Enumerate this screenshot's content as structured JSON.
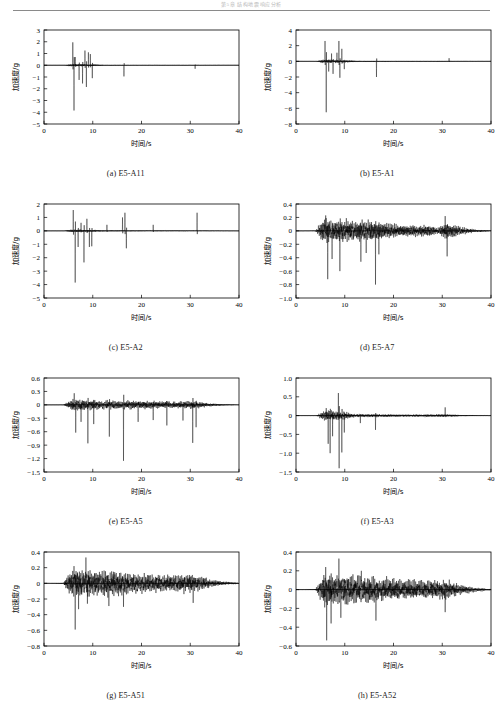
{
  "running_head": "第5章 结构地震响应分析",
  "figure": {
    "axis_labels": {
      "x": "时间/s",
      "y": "加速度/g"
    },
    "x_range": [
      0,
      40
    ],
    "x_ticks": [
      0,
      10,
      20,
      30,
      40
    ]
  },
  "chart_data": [
    {
      "type": "line",
      "id": "a",
      "caption": "(a) E5-A11",
      "xlabel": "时间/s",
      "ylabel": "加速度/g",
      "xlim": [
        0,
        40
      ],
      "ylim": [
        -5,
        3
      ],
      "xticks": [
        0,
        10,
        20,
        30,
        40
      ],
      "yticks": [
        -5,
        -4,
        -3,
        -2,
        -1,
        0,
        1,
        2,
        3
      ],
      "ytick_labels": [
        "-5",
        "-4",
        "-3",
        "-2",
        "-1",
        "0",
        "1",
        "2",
        "3"
      ],
      "grid": false,
      "legend": null,
      "description": "Acceleration time-history, sparse sharp spikes concentrated at 5-11 s, isolated spikes near 16.5 s and 30-32 s",
      "peaks": [
        {
          "t": 5.9,
          "v": 1.95
        },
        {
          "t": 6.15,
          "v": -3.85
        },
        {
          "t": 6.4,
          "v": 0.7
        },
        {
          "t": 7.2,
          "v": -1.25
        },
        {
          "t": 7.9,
          "v": -1.55
        },
        {
          "t": 8.4,
          "v": 1.25
        },
        {
          "t": 8.7,
          "v": -1.85
        },
        {
          "t": 9.1,
          "v": 1.1
        },
        {
          "t": 9.5,
          "v": 0.95
        },
        {
          "t": 9.9,
          "v": -1.1
        },
        {
          "t": 16.4,
          "v": -0.95
        },
        {
          "t": 31.0,
          "v": -0.3
        }
      ],
      "noise_amp": 0.09,
      "envelope": [
        {
          "t": 0,
          "a": 0.0
        },
        {
          "t": 4.2,
          "a": 0.02
        },
        {
          "t": 5.5,
          "a": 0.55
        },
        {
          "t": 7.5,
          "a": 0.5
        },
        {
          "t": 10.5,
          "a": 0.35
        },
        {
          "t": 12.5,
          "a": 0.12
        },
        {
          "t": 20,
          "a": 0.07
        },
        {
          "t": 30,
          "a": 0.07
        },
        {
          "t": 34,
          "a": 0.05
        },
        {
          "t": 40,
          "a": 0.01
        }
      ]
    },
    {
      "type": "line",
      "id": "b",
      "caption": "(b) E5-A1",
      "xlabel": "时间/s",
      "ylabel": "加速度/g",
      "xlim": [
        0,
        40
      ],
      "ylim": [
        -8,
        4
      ],
      "xticks": [
        0,
        10,
        20,
        30,
        40
      ],
      "yticks": [
        -8,
        -6,
        -4,
        -2,
        0,
        2,
        4
      ],
      "ytick_labels": [
        "-8",
        "-6",
        "-4",
        "-2",
        "0",
        "2",
        "4"
      ],
      "grid": false,
      "legend": null,
      "description": "Acceleration time-history with large negative spike -6.5 g near 6.2 s, activity 5-11 s, isolated spike near 16.5 s",
      "peaks": [
        {
          "t": 5.95,
          "v": 2.6
        },
        {
          "t": 6.2,
          "v": -6.5
        },
        {
          "t": 6.7,
          "v": -1.3
        },
        {
          "t": 7.3,
          "v": 1.0
        },
        {
          "t": 7.6,
          "v": -1.6
        },
        {
          "t": 8.4,
          "v": 1.1
        },
        {
          "t": 8.8,
          "v": 2.6
        },
        {
          "t": 9.0,
          "v": -2.1
        },
        {
          "t": 9.4,
          "v": 1.6
        },
        {
          "t": 9.9,
          "v": -1.0
        },
        {
          "t": 16.5,
          "v": -2.0
        },
        {
          "t": 31.4,
          "v": 0.4
        }
      ],
      "noise_amp": 0.14,
      "envelope": [
        {
          "t": 0,
          "a": 0.0
        },
        {
          "t": 4.2,
          "a": 0.03
        },
        {
          "t": 5.5,
          "a": 0.8
        },
        {
          "t": 7.5,
          "a": 0.7
        },
        {
          "t": 10.5,
          "a": 0.5
        },
        {
          "t": 12.5,
          "a": 0.18
        },
        {
          "t": 20,
          "a": 0.1
        },
        {
          "t": 30,
          "a": 0.1
        },
        {
          "t": 34,
          "a": 0.06
        },
        {
          "t": 40,
          "a": 0.01
        }
      ]
    },
    {
      "type": "line",
      "id": "c",
      "caption": "(c) E5-A2",
      "xlabel": "时间/s",
      "ylabel": "加速度/g",
      "xlim": [
        0,
        40
      ],
      "ylim": [
        -5,
        2
      ],
      "xticks": [
        0,
        10,
        20,
        30,
        40
      ],
      "yticks": [
        -5,
        -4,
        -3,
        -2,
        -1,
        0,
        1,
        2
      ],
      "ytick_labels": [
        "-5",
        "-4",
        "-3",
        "-2",
        "-1",
        "0",
        "1",
        "2"
      ],
      "grid": false,
      "legend": null,
      "description": "Spiky record, largest negative -3.85 g at 6.4 s, positive spikes to 1.4 g near 16.6 s and 31.4 s",
      "peaks": [
        {
          "t": 6.0,
          "v": 1.55
        },
        {
          "t": 6.4,
          "v": -3.85
        },
        {
          "t": 7.0,
          "v": -1.2
        },
        {
          "t": 7.6,
          "v": 0.6
        },
        {
          "t": 8.2,
          "v": -2.35
        },
        {
          "t": 8.8,
          "v": 0.9
        },
        {
          "t": 9.3,
          "v": -1.2
        },
        {
          "t": 9.8,
          "v": -1.15
        },
        {
          "t": 12.9,
          "v": 0.45
        },
        {
          "t": 16.1,
          "v": 1.0
        },
        {
          "t": 16.6,
          "v": 1.35
        },
        {
          "t": 16.9,
          "v": -1.3
        },
        {
          "t": 22.4,
          "v": 0.45
        },
        {
          "t": 31.4,
          "v": 1.35
        }
      ],
      "noise_amp": 0.1,
      "envelope": [
        {
          "t": 0,
          "a": 0.0
        },
        {
          "t": 4.2,
          "a": 0.02
        },
        {
          "t": 5.5,
          "a": 0.45
        },
        {
          "t": 7.5,
          "a": 0.42
        },
        {
          "t": 10.5,
          "a": 0.3
        },
        {
          "t": 12.5,
          "a": 0.16
        },
        {
          "t": 20,
          "a": 0.12
        },
        {
          "t": 30,
          "a": 0.1
        },
        {
          "t": 34,
          "a": 0.07
        },
        {
          "t": 40,
          "a": 0.02
        }
      ]
    },
    {
      "type": "line",
      "id": "d",
      "caption": "(d) E5-A7",
      "xlabel": "时间/s",
      "ylabel": "加速度/g",
      "xlim": [
        0,
        40
      ],
      "ylim": [
        -1.0,
        0.4
      ],
      "xticks": [
        0,
        10,
        20,
        30,
        40
      ],
      "yticks": [
        -1.0,
        -0.8,
        -0.6,
        -0.4,
        -0.2,
        0,
        0.2,
        0.4
      ],
      "ytick_labels": [
        "-1.0",
        "-0.8",
        "-0.6",
        "-0.4",
        "-0.2",
        "0",
        "0.2",
        "0.4"
      ],
      "grid": false,
      "legend": null,
      "description": "Dense broadband vibration 4-37 s, asymmetric with negative spikes to -0.8 g near 16.3 s",
      "peaks": [
        {
          "t": 6.1,
          "v": 0.23
        },
        {
          "t": 6.5,
          "v": -0.72
        },
        {
          "t": 7.4,
          "v": -0.42
        },
        {
          "t": 9.0,
          "v": -0.6
        },
        {
          "t": 13.3,
          "v": -0.46
        },
        {
          "t": 14.4,
          "v": -0.33
        },
        {
          "t": 16.3,
          "v": -0.8
        },
        {
          "t": 17.0,
          "v": -0.35
        },
        {
          "t": 30.6,
          "v": 0.22
        },
        {
          "t": 31.0,
          "v": -0.38
        }
      ],
      "noise_amp": 0.075,
      "envelope": [
        {
          "t": 0,
          "a": 0.0
        },
        {
          "t": 4.0,
          "a": 0.02
        },
        {
          "t": 5.5,
          "a": 1.0
        },
        {
          "t": 10,
          "a": 0.95
        },
        {
          "t": 16,
          "a": 0.85
        },
        {
          "t": 22,
          "a": 0.45
        },
        {
          "t": 27.5,
          "a": 0.5
        },
        {
          "t": 29,
          "a": 0.25
        },
        {
          "t": 31,
          "a": 0.75
        },
        {
          "t": 34,
          "a": 0.3
        },
        {
          "t": 37,
          "a": 0.12
        },
        {
          "t": 40,
          "a": 0.03
        }
      ]
    },
    {
      "type": "line",
      "id": "e",
      "caption": "(e) E5-A5",
      "xlabel": "时间/s",
      "ylabel": "加速度/g",
      "xlim": [
        0,
        40
      ],
      "ylim": [
        -1.5,
        0.6
      ],
      "xticks": [
        0,
        10,
        20,
        30,
        40
      ],
      "yticks": [
        -1.5,
        -1.2,
        -0.9,
        -0.6,
        -0.3,
        0,
        0.3,
        0.6
      ],
      "ytick_labels": [
        "-1.5",
        "-1.2",
        "-0.9",
        "-0.6",
        "-0.3",
        "0",
        "0.3",
        "0.6"
      ],
      "grid": false,
      "legend": null,
      "description": "Dense vibration with repeated downward spikes, largest -1.25 g near 16.3 s",
      "peaks": [
        {
          "t": 6.2,
          "v": 0.26
        },
        {
          "t": 6.5,
          "v": -0.62
        },
        {
          "t": 7.6,
          "v": -0.38
        },
        {
          "t": 9.0,
          "v": -0.86
        },
        {
          "t": 10.2,
          "v": -0.43
        },
        {
          "t": 13.4,
          "v": -0.71
        },
        {
          "t": 16.3,
          "v": -1.25
        },
        {
          "t": 19.3,
          "v": -0.38
        },
        {
          "t": 22.4,
          "v": -0.34
        },
        {
          "t": 25.2,
          "v": -0.46
        },
        {
          "t": 28.5,
          "v": -0.35
        },
        {
          "t": 30.5,
          "v": -0.85
        },
        {
          "t": 31.2,
          "v": -0.5
        }
      ],
      "noise_amp": 0.06,
      "envelope": [
        {
          "t": 0,
          "a": 0.0
        },
        {
          "t": 4.0,
          "a": 0.02
        },
        {
          "t": 5.8,
          "a": 1.0
        },
        {
          "t": 10,
          "a": 0.75
        },
        {
          "t": 16,
          "a": 0.7
        },
        {
          "t": 22,
          "a": 0.6
        },
        {
          "t": 28,
          "a": 0.55
        },
        {
          "t": 31,
          "a": 0.6
        },
        {
          "t": 34,
          "a": 0.25
        },
        {
          "t": 37,
          "a": 0.1
        },
        {
          "t": 40,
          "a": 0.03
        }
      ]
    },
    {
      "type": "line",
      "id": "f",
      "caption": "(f) E5-A3",
      "xlabel": "时间/s",
      "ylabel": "加速度/g",
      "xlim": [
        0,
        40
      ],
      "ylim": [
        -1.5,
        1.0
      ],
      "xticks": [
        0,
        10,
        20,
        30,
        40
      ],
      "yticks": [
        -1.5,
        -1.0,
        -0.5,
        0,
        0.5,
        1.0
      ],
      "ytick_labels": [
        "-1.5",
        "-1.0",
        "-0.5",
        "0",
        "0.5",
        "1.0"
      ],
      "grid": false,
      "legend": null,
      "description": "Burst of strong motion 5.5-10 s with peak -1.4 g at 8.8 s, then low-level vibration to 33 s",
      "peaks": [
        {
          "t": 6.2,
          "v": 0.2
        },
        {
          "t": 6.6,
          "v": -0.75
        },
        {
          "t": 7.0,
          "v": -1.0
        },
        {
          "t": 7.5,
          "v": -0.55
        },
        {
          "t": 8.7,
          "v": 0.6
        },
        {
          "t": 8.85,
          "v": -1.4
        },
        {
          "t": 9.4,
          "v": -0.98
        },
        {
          "t": 9.9,
          "v": -0.45
        },
        {
          "t": 13.2,
          "v": -0.2
        },
        {
          "t": 16.3,
          "v": -0.38
        },
        {
          "t": 30.6,
          "v": 0.22
        }
      ],
      "noise_amp": 0.06,
      "envelope": [
        {
          "t": 0,
          "a": 0.0
        },
        {
          "t": 4.2,
          "a": 0.02
        },
        {
          "t": 5.8,
          "a": 1.0
        },
        {
          "t": 10,
          "a": 0.8
        },
        {
          "t": 12,
          "a": 0.3
        },
        {
          "t": 16,
          "a": 0.3
        },
        {
          "t": 22,
          "a": 0.22
        },
        {
          "t": 28,
          "a": 0.26
        },
        {
          "t": 31,
          "a": 0.3
        },
        {
          "t": 34,
          "a": 0.12
        },
        {
          "t": 40,
          "a": 0.02
        }
      ]
    },
    {
      "type": "line",
      "id": "g",
      "caption": "(g) E5-A51",
      "xlabel": "时间/s",
      "ylabel": "加速度/g",
      "xlim": [
        0,
        40
      ],
      "ylim": [
        -0.8,
        0.4
      ],
      "xticks": [
        0,
        10,
        20,
        30,
        40
      ],
      "yticks": [
        -0.8,
        -0.6,
        -0.4,
        -0.2,
        0,
        0.2,
        0.4
      ],
      "ytick_labels": [
        "-0.8",
        "-0.6",
        "-0.4",
        "-0.2",
        "0",
        "0.2",
        "0.4"
      ],
      "grid": false,
      "legend": null,
      "description": "Continuous dense oscillation 4-38 s, peak -0.6 g near 6.4 s, gradually decaying after 30 s",
      "peaks": [
        {
          "t": 6.15,
          "v": 0.22
        },
        {
          "t": 6.4,
          "v": -0.59
        },
        {
          "t": 7.1,
          "v": -0.33
        },
        {
          "t": 8.6,
          "v": 0.33
        },
        {
          "t": 8.9,
          "v": -0.26
        },
        {
          "t": 13.3,
          "v": -0.29
        },
        {
          "t": 16.3,
          "v": -0.3
        },
        {
          "t": 30.6,
          "v": -0.25
        }
      ],
      "noise_amp": 0.085,
      "envelope": [
        {
          "t": 0,
          "a": 0.0
        },
        {
          "t": 4.0,
          "a": 0.03
        },
        {
          "t": 5.8,
          "a": 1.0
        },
        {
          "t": 10,
          "a": 0.85
        },
        {
          "t": 14,
          "a": 0.8
        },
        {
          "t": 20,
          "a": 0.62
        },
        {
          "t": 26,
          "a": 0.55
        },
        {
          "t": 30.5,
          "a": 0.6
        },
        {
          "t": 34,
          "a": 0.28
        },
        {
          "t": 37,
          "a": 0.12
        },
        {
          "t": 40,
          "a": 0.04
        }
      ]
    },
    {
      "type": "line",
      "id": "h",
      "caption": "(h) E5-A52",
      "xlabel": "时间/s",
      "ylabel": "加速度/g",
      "xlim": [
        0,
        40
      ],
      "ylim": [
        -0.6,
        0.4
      ],
      "xticks": [
        0,
        10,
        20,
        30,
        40
      ],
      "yticks": [
        -0.6,
        -0.4,
        -0.2,
        0,
        0.2,
        0.4
      ],
      "ytick_labels": [
        "-0.6",
        "-0.4",
        "-0.2",
        "0",
        "0.2",
        "0.4"
      ],
      "grid": false,
      "legend": null,
      "description": "Continuous dense oscillation 4-38 s, max positive 0.33 g at 8.8 s, max negative -0.54 g at 6.3 s",
      "peaks": [
        {
          "t": 6.1,
          "v": 0.24
        },
        {
          "t": 6.3,
          "v": -0.54
        },
        {
          "t": 7.2,
          "v": -0.36
        },
        {
          "t": 8.8,
          "v": 0.33
        },
        {
          "t": 9.2,
          "v": -0.3
        },
        {
          "t": 13.4,
          "v": 0.2
        },
        {
          "t": 16.4,
          "v": -0.33
        },
        {
          "t": 30.6,
          "v": -0.24
        }
      ],
      "noise_amp": 0.08,
      "envelope": [
        {
          "t": 0,
          "a": 0.0
        },
        {
          "t": 4.0,
          "a": 0.03
        },
        {
          "t": 5.8,
          "a": 1.0
        },
        {
          "t": 10,
          "a": 0.85
        },
        {
          "t": 14,
          "a": 0.78
        },
        {
          "t": 20,
          "a": 0.6
        },
        {
          "t": 26,
          "a": 0.52
        },
        {
          "t": 30.5,
          "a": 0.6
        },
        {
          "t": 34,
          "a": 0.26
        },
        {
          "t": 37,
          "a": 0.12
        },
        {
          "t": 40,
          "a": 0.04
        }
      ]
    }
  ]
}
